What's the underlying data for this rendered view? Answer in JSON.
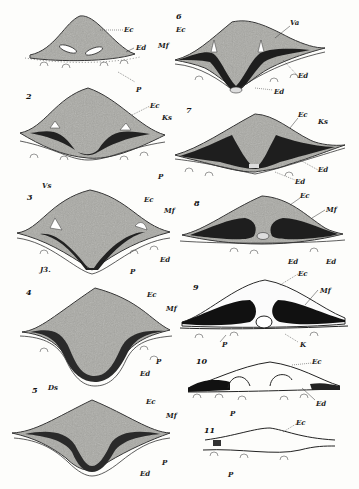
{
  "figure": {
    "colors": {
      "mound_fill": "#a9a9a4",
      "mesoderm_dark": "#1e1e1e",
      "outline": "#2a2a2a",
      "background": "#fdfdfb"
    },
    "panels": [
      {
        "id": "1",
        "number": "",
        "labels": [
          "Ec",
          "Ed",
          "Mf",
          "P"
        ]
      },
      {
        "id": "2",
        "number": "2",
        "labels": [
          "Ec",
          "Ks",
          "P"
        ]
      },
      {
        "id": "3",
        "number": "3",
        "labels": [
          "Vs",
          "Ec",
          "Mf",
          "Ed",
          "P",
          "J3."
        ]
      },
      {
        "id": "4",
        "number": "4",
        "labels": [
          "Ec",
          "Mf",
          "P",
          "Ed",
          "Ds"
        ]
      },
      {
        "id": "5",
        "number": "5",
        "labels": [
          "Ds",
          "Ec",
          "Mf",
          "P",
          "Ed"
        ]
      },
      {
        "id": "6",
        "number": "6",
        "labels": [
          "Ec",
          "Va",
          "Ed",
          "Ed"
        ]
      },
      {
        "id": "7",
        "number": "7",
        "labels": [
          "Ec",
          "Ks",
          "Ed",
          "Ed"
        ]
      },
      {
        "id": "8",
        "number": "8",
        "labels": [
          "Ec",
          "Mf",
          "Ed",
          "Ed"
        ]
      },
      {
        "id": "9",
        "number": "9",
        "labels": [
          "Ec",
          "Mf",
          "P",
          "K"
        ]
      },
      {
        "id": "10",
        "number": "10",
        "labels": [
          "Ec",
          "Ed",
          "P"
        ]
      },
      {
        "id": "11",
        "number": "11",
        "labels": [
          "Ec",
          "P"
        ]
      }
    ]
  },
  "labels": {
    "p1": {
      "ec": "Ec",
      "ed": "Ed",
      "mf": "Mf",
      "p": "P"
    },
    "p2": {
      "num": "2",
      "ec": "Ec",
      "ks": "Ks",
      "p": "P"
    },
    "p3": {
      "num": "3",
      "vs": "Vs",
      "ec": "Ec",
      "mf": "Mf",
      "ed": "Ed",
      "p": "P",
      "j": "J3."
    },
    "p4": {
      "num": "4",
      "ec": "Ec",
      "mf": "Mf",
      "p": "P",
      "ed": "Ed",
      "ds": "Ds"
    },
    "p5": {
      "num": "5",
      "ec": "Ec",
      "mf": "Mf",
      "p": "P",
      "ed": "Ed"
    },
    "p6": {
      "num": "6",
      "ec": "Ec",
      "va": "Va",
      "ed1": "Ed",
      "ed2": "Ed"
    },
    "p7": {
      "num": "7",
      "ec": "Ec",
      "ks": "Ks",
      "ed1": "Ed",
      "ed2": "Ed"
    },
    "p8": {
      "num": "8",
      "ec": "Ec",
      "mf": "Mf",
      "ed1": "Ed",
      "ed2": "Ed"
    },
    "p9": {
      "num": "9",
      "ec": "Ec",
      "mf": "Mf",
      "p": "P",
      "k": "K"
    },
    "p10": {
      "num": "10",
      "ec": "Ec",
      "ed": "Ed",
      "p": "P"
    },
    "p11": {
      "num": "11",
      "ec": "Ec",
      "p": "P"
    }
  }
}
